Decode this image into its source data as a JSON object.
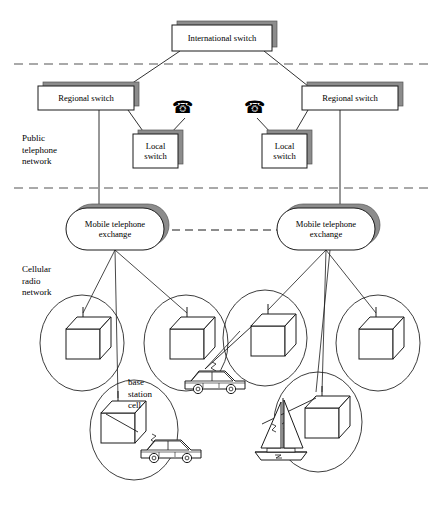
{
  "figure": {
    "type": "network-diagram",
    "title_visible": false,
    "width": 440,
    "height": 511,
    "background": "#ffffff",
    "line_color": "#1a1a1a",
    "shadow_color": "#808080"
  },
  "region_labels": [
    {
      "name": "public-telephone-network",
      "text": "Public\ntelephone\nnetwork",
      "x": 22,
      "y": 133
    },
    {
      "name": "cellular-radio-network",
      "text": "Cellular\nradio\nnetwork",
      "x": 22,
      "y": 264
    },
    {
      "name": "base-station-cell",
      "text": "base\nstation\ncell",
      "x": 128,
      "y": 377
    }
  ],
  "dividers": [
    {
      "name": "divider-top",
      "y": 64,
      "x1": 14,
      "x2": 430,
      "style": "dashed"
    },
    {
      "name": "divider-middle",
      "y": 188,
      "x1": 14,
      "x2": 430,
      "style": "dashed"
    }
  ],
  "nodes": {
    "international_switch": {
      "label": "International switch",
      "x": 172,
      "y": 25,
      "w": 100,
      "h": 26
    },
    "regional_switch_left": {
      "label": "Regional switch",
      "x": 38,
      "y": 86,
      "w": 96,
      "h": 24
    },
    "regional_switch_right": {
      "label": "Regional switch",
      "x": 302,
      "y": 86,
      "w": 96,
      "h": 24
    },
    "local_switch_left": {
      "label": "Local\nswitch",
      "x": 133,
      "y": 134,
      "w": 45,
      "h": 34
    },
    "local_switch_right": {
      "label": "Local\nswitch",
      "x": 262,
      "y": 134,
      "w": 45,
      "h": 34
    },
    "mobile_exchange_left": {
      "label": "Mobile telephone\nexchange",
      "x": 66,
      "y": 208,
      "w": 98,
      "h": 42
    },
    "mobile_exchange_right": {
      "label": "Mobile telephone\nexchange",
      "x": 277,
      "y": 208,
      "w": 98,
      "h": 42
    }
  },
  "telephones": [
    {
      "name": "telephone-left",
      "glyph": "☎",
      "x": 172,
      "y": 99
    },
    {
      "name": "telephone-right",
      "glyph": "☎",
      "x": 244,
      "y": 99
    }
  ],
  "cells": [
    {
      "name": "cell-1",
      "cx": 82,
      "cy": 343,
      "rx": 42,
      "ry": 48,
      "base_station": {
        "cx": 83,
        "cy": 341
      }
    },
    {
      "name": "cell-2",
      "cx": 186,
      "cy": 343,
      "rx": 42,
      "ry": 48,
      "base_station": {
        "cx": 187,
        "cy": 341
      }
    },
    {
      "name": "cell-3",
      "cx": 265,
      "cy": 338,
      "rx": 42,
      "ry": 48,
      "base_station": {
        "cx": 268,
        "cy": 338
      }
    },
    {
      "name": "cell-4",
      "cx": 378,
      "cy": 343,
      "rx": 42,
      "ry": 48,
      "base_station": {
        "cx": 376,
        "cy": 341
      }
    },
    {
      "name": "cell-5",
      "cx": 134,
      "cy": 430,
      "rx": 44,
      "ry": 50,
      "base_station": {
        "cx": 118,
        "cy": 425
      }
    },
    {
      "name": "cell-6",
      "cx": 318,
      "cy": 422,
      "rx": 44,
      "ry": 50,
      "base_station": {
        "cx": 322,
        "cy": 420
      }
    }
  ],
  "vehicles": [
    {
      "name": "car-upper",
      "x": 184,
      "y": 371,
      "scale": 1.0
    },
    {
      "name": "car-lower",
      "x": 140,
      "y": 444,
      "scale": 1.0
    },
    {
      "name": "sailboat",
      "x": 248,
      "y": 400,
      "scale": 1.0
    }
  ],
  "radio_links": [
    {
      "name": "radio-link-car-upper",
      "from": "car-upper",
      "to": "cell-3-base-station"
    },
    {
      "name": "radio-link-car-lower",
      "from": "car-lower",
      "to": "cell-5-base-station"
    },
    {
      "name": "radio-link-sailboat",
      "from": "sailboat",
      "to": "cell-6-base-station"
    }
  ],
  "connections": [
    {
      "from": "international_switch",
      "to": "regional_switch_left"
    },
    {
      "from": "international_switch",
      "to": "regional_switch_right"
    },
    {
      "from": "regional_switch_left",
      "to": "local_switch_left"
    },
    {
      "from": "regional_switch_right",
      "to": "local_switch_right"
    },
    {
      "from": "telephone-left",
      "to": "local_switch_left"
    },
    {
      "from": "telephone-right",
      "to": "local_switch_right"
    },
    {
      "from": "regional_switch_left",
      "to": "mobile_exchange_left"
    },
    {
      "from": "regional_switch_right",
      "to": "mobile_exchange_right"
    },
    {
      "from": "mobile_exchange_left",
      "to": "mobile_exchange_right",
      "style": "dashed"
    },
    {
      "from": "mobile_exchange_left",
      "to": "cell-1"
    },
    {
      "from": "mobile_exchange_left",
      "to": "cell-2"
    },
    {
      "from": "mobile_exchange_left",
      "to": "cell-5"
    },
    {
      "from": "mobile_exchange_right",
      "to": "cell-3"
    },
    {
      "from": "mobile_exchange_right",
      "to": "cell-4"
    },
    {
      "from": "mobile_exchange_right",
      "to": "cell-6"
    }
  ]
}
